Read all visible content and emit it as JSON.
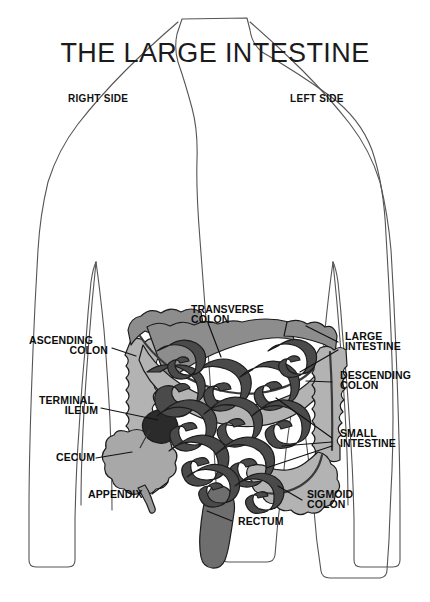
{
  "title": "THE LARGE INTESTINE",
  "orientation": {
    "right_side": "RIGHT SIDE",
    "left_side": "LEFT SIDE"
  },
  "labels": {
    "transverse_colon_line1": "TRANSVERSE",
    "transverse_colon_line2": "COLON",
    "ascending_colon_line1": "ASCENDING",
    "ascending_colon_line2": "COLON",
    "terminal_ileum_line1": "TERMINAL",
    "terminal_ileum_line2": "ILEUM",
    "cecum": "CECUM",
    "appendix": "APPENDIX",
    "large_intestine_line1": "LARGE",
    "large_intestine_line2": "INTESTINE",
    "descending_colon_line1": "DESCENDING",
    "descending_colon_line2": "COLON",
    "small_intestine_line1": "SMALL",
    "small_intestine_line2": "INTESTINE",
    "sigmoid_colon_line1": "SIGMOID",
    "sigmoid_colon_line2": "COLON",
    "rectum": "RECTUM"
  },
  "colors": {
    "background": "#ffffff",
    "body_outline": "#555555",
    "colon_light": "#b3b3b3",
    "colon_mid": "#8d8d8d",
    "colon_dark_band": "#7c7c7c",
    "small_intestine": "#4a4a4a",
    "terminal_ileum": "#2b2b2b",
    "rectum": "#6e6e6e",
    "label_text": "#0d0d0d",
    "title_text": "#1b1b1b",
    "leader_line": "#111111"
  }
}
